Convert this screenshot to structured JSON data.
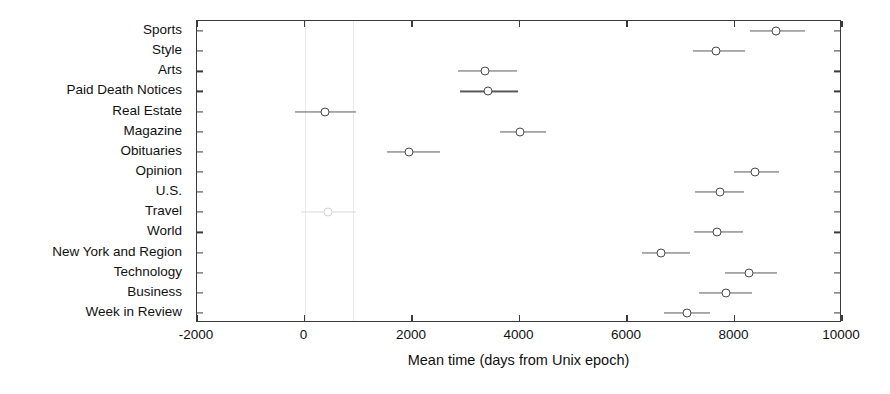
{
  "chart_data": {
    "type": "scatter",
    "title": "",
    "xlabel": "Mean time (days from Unix epoch)",
    "ylabel": "",
    "xlim": [
      -2000,
      10000
    ],
    "xticks": [
      -2000,
      0,
      2000,
      4000,
      6000,
      8000,
      10000
    ],
    "xticklabels": [
      "-2000",
      "0",
      "2000",
      "4000",
      "6000",
      "8000",
      "10000"
    ],
    "grid": false,
    "legend": "none",
    "orientation": "horizontal",
    "categories": [
      "Sports",
      "Style",
      "Arts",
      "Paid Death Notices",
      "Real Estate",
      "Magazine",
      "Obituaries",
      "Opinion",
      "U.S.",
      "Travel",
      "World",
      "New York and Region",
      "Technology",
      "Business",
      "Week in Review"
    ],
    "values": [
      8770,
      7650,
      3360,
      3420,
      390,
      4010,
      1950,
      8380,
      7730,
      430,
      7670,
      6630,
      8270,
      7840,
      7120
    ],
    "error_low": [
      8290,
      7220,
      2860,
      2890,
      -170,
      3630,
      1540,
      7990,
      7270,
      -60,
      7250,
      6270,
      7830,
      7340,
      6680
    ],
    "error_high": [
      9320,
      8190,
      3960,
      3980,
      960,
      4500,
      2520,
      8830,
      8180,
      950,
      8160,
      7180,
      8790,
      8330,
      7550
    ],
    "points": [
      {
        "label": "Sports",
        "mean": 8770,
        "low": 8290,
        "high": 9320,
        "faint": false
      },
      {
        "label": "Style",
        "mean": 7650,
        "low": 7220,
        "high": 8190,
        "faint": false
      },
      {
        "label": "Arts",
        "mean": 3360,
        "low": 2860,
        "high": 3960,
        "faint": false
      },
      {
        "label": "Paid Death Notices",
        "mean": 3420,
        "low": 2890,
        "high": 3980,
        "faint": false
      },
      {
        "label": "Real Estate",
        "mean": 390,
        "low": -170,
        "high": 960,
        "faint": false
      },
      {
        "label": "Magazine",
        "mean": 4010,
        "low": 3630,
        "high": 4500,
        "faint": false
      },
      {
        "label": "Obituaries",
        "mean": 1950,
        "low": 1540,
        "high": 2520,
        "faint": false
      },
      {
        "label": "Opinion",
        "mean": 8380,
        "low": 7990,
        "high": 8830,
        "faint": false
      },
      {
        "label": "U.S.",
        "mean": 7730,
        "low": 7270,
        "high": 8180,
        "faint": false
      },
      {
        "label": "Travel",
        "mean": 430,
        "low": -60,
        "high": 950,
        "faint": true
      },
      {
        "label": "World",
        "mean": 7670,
        "low": 7250,
        "high": 8160,
        "faint": false
      },
      {
        "label": "New York and Region",
        "mean": 6630,
        "low": 6270,
        "high": 7180,
        "faint": false
      },
      {
        "label": "Technology",
        "mean": 8270,
        "low": 7830,
        "high": 8790,
        "faint": false
      },
      {
        "label": "Business",
        "mean": 7840,
        "low": 7340,
        "high": 8330,
        "faint": false
      },
      {
        "label": "Week in Review",
        "mean": 7120,
        "low": 6680,
        "high": 7550,
        "faint": false
      }
    ],
    "guides": [
      0,
      900
    ],
    "colors": {
      "marker_edge": "#4a4a4a",
      "marker_face": "#ffffff",
      "error_bar": "#5a5a5a",
      "axis": "#3a3a3a",
      "text": "#111111",
      "guide": "#e9e9e9",
      "background": "#ffffff"
    }
  }
}
